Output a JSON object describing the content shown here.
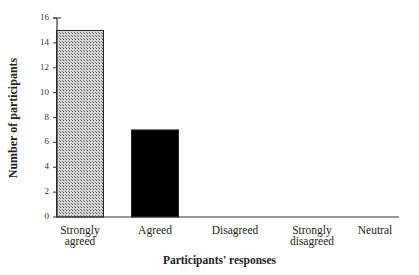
{
  "chart_data": {
    "type": "bar",
    "title": "",
    "xlabel": "Participants' responses",
    "ylabel": "Number of participants",
    "categories": [
      "Strongly agreed",
      "Agreed",
      "Disagreed",
      "Strongly disagreed",
      "Neutral"
    ],
    "category_lines": [
      [
        "Strongly",
        "agreed"
      ],
      [
        "Agreed"
      ],
      [
        "Disagreed"
      ],
      [
        "Strongly",
        "disagreed"
      ],
      [
        "Neutral"
      ]
    ],
    "values": [
      15,
      7,
      0,
      0,
      0
    ],
    "ylim": [
      0,
      16
    ],
    "yticks": [
      0,
      2,
      4,
      6,
      8,
      10,
      12,
      14,
      16
    ],
    "grid": false,
    "legend": null,
    "bar_styles": [
      "hatched-gray",
      "black",
      "none",
      "none",
      "none"
    ],
    "colors": {
      "hatched": "#9a9a9a",
      "solid": "#000000",
      "axis": "#333333"
    }
  }
}
